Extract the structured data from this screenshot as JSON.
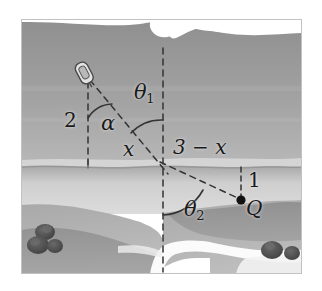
{
  "figure": {
    "type": "geometry-diagram",
    "canvas": {
      "width": 322,
      "height": 291
    }
  },
  "labels": [
    {
      "id": "dist-2",
      "text": "2",
      "role": "vertical-distance-boat-to-shore",
      "x": 64,
      "y": 120,
      "size": 20,
      "italic": false
    },
    {
      "id": "angle-alpha",
      "text": "α",
      "role": "angle-at-boat",
      "x": 101,
      "y": 123,
      "size": 20,
      "italic": true
    },
    {
      "id": "angle-t1",
      "text": "θ",
      "sub": "1",
      "role": "angle-of-incidence",
      "x": 135,
      "y": 92,
      "size": 20,
      "italic": true
    },
    {
      "id": "dist-x",
      "text": "x",
      "role": "horizontal-distance-left",
      "x": 123,
      "y": 148,
      "size": 20,
      "italic": true
    },
    {
      "id": "dist-3mx",
      "text": "3 − x",
      "role": "horizontal-distance-right",
      "x": 176,
      "y": 147,
      "size": 20,
      "italic": true
    },
    {
      "id": "dist-1",
      "text": "1",
      "role": "vertical-distance-shore-to-Q",
      "x": 247,
      "y": 177,
      "size": 20,
      "italic": false
    },
    {
      "id": "angle-t2",
      "text": "θ",
      "sub": "2",
      "role": "angle-of-refraction",
      "x": 186,
      "y": 208,
      "size": 20,
      "italic": true
    },
    {
      "id": "point-Q",
      "text": "Q",
      "role": "target-point-label",
      "x": 247,
      "y": 203,
      "size": 20,
      "italic": true
    }
  ],
  "geometry": {
    "boat_point": {
      "x": 88,
      "y": 80
    },
    "shore_crossing": {
      "x": 163,
      "y": 167
    },
    "q_point": {
      "x": 241,
      "y": 200
    },
    "shore_y": 167,
    "vertical_left_x": 88,
    "vertical_mid_x": 163,
    "vertical_right_x": 241
  },
  "colors": {
    "water_upper": "#9b9b9b",
    "water_band": "#c9c9c9",
    "land_mid": "#b0b0b0",
    "land_dark": "#8f8f8f",
    "shore_pale": "#d7d7d7",
    "sky_white": "#ffffff",
    "bush": "#4f4f4f",
    "line": "#3a3a3a",
    "text": "#1a1a1a"
  }
}
